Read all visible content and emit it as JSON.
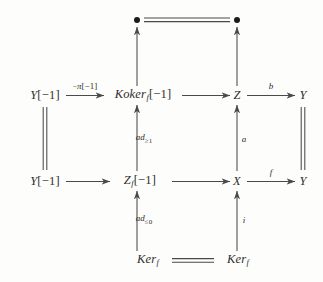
{
  "figure": {
    "kind": "commutative-diagram",
    "stroke_color": "#4a4a4a",
    "text_color": "#2e2e2e",
    "background_color": "#fdfdfb"
  },
  "nodes": [
    {
      "id": "dot-top-left",
      "label": "●",
      "plain": "bullet",
      "x": 137,
      "y": 20,
      "type": "dot"
    },
    {
      "id": "dot-top-right",
      "label": "●",
      "plain": "bullet",
      "x": 237,
      "y": 20,
      "type": "dot"
    },
    {
      "id": "y-shift-top",
      "label": "Y[−1]",
      "plain": "Y[-1]",
      "x": 45,
      "y": 95,
      "type": "text"
    },
    {
      "id": "koker-f-shift",
      "label": "Koker_f[−1]",
      "plain": "Koker_f[-1]",
      "x": 143,
      "y": 95,
      "type": "text"
    },
    {
      "id": "z",
      "label": "Z",
      "plain": "Z",
      "x": 237,
      "y": 95,
      "type": "text"
    },
    {
      "id": "y-top-right",
      "label": "Y",
      "plain": "Y",
      "x": 303,
      "y": 95,
      "type": "text"
    },
    {
      "id": "y-shift-bottom",
      "label": "Y[−1]",
      "plain": "Y[-1]",
      "x": 45,
      "y": 181,
      "type": "text"
    },
    {
      "id": "z-f-shift",
      "label": "Z_f[−1]",
      "plain": "Z_f[-1]",
      "x": 140,
      "y": 181,
      "type": "text"
    },
    {
      "id": "x",
      "label": "X",
      "plain": "X",
      "x": 237,
      "y": 181,
      "type": "text"
    },
    {
      "id": "y-bottom-right",
      "label": "Y",
      "plain": "Y",
      "x": 303,
      "y": 181,
      "type": "text"
    },
    {
      "id": "ker-f-left",
      "label": "Ker_f",
      "plain": "Ker_f",
      "x": 148,
      "y": 260,
      "type": "text"
    },
    {
      "id": "ker-f-right",
      "label": "Ker_f",
      "plain": "Ker_f",
      "x": 238,
      "y": 260,
      "type": "text"
    }
  ],
  "edges": [
    {
      "id": "edge-dot-equality",
      "from": "dot-top-left",
      "to": "dot-top-right",
      "style": "double-line",
      "direction": "horizontal",
      "label": ""
    },
    {
      "id": "edge-koker-to-dot",
      "from": "koker-f-shift",
      "to": "dot-top-left",
      "style": "arrow",
      "direction": "up",
      "label": ""
    },
    {
      "id": "edge-z-to-dot",
      "from": "z",
      "to": "dot-top-right",
      "style": "arrow",
      "direction": "up",
      "label": ""
    },
    {
      "id": "edge-y-to-koker",
      "from": "y-shift-top",
      "to": "koker-f-shift",
      "style": "arrow",
      "direction": "right",
      "label": "−π[−1]"
    },
    {
      "id": "edge-koker-to-z",
      "from": "koker-f-shift",
      "to": "z",
      "style": "arrow",
      "direction": "right",
      "label": ""
    },
    {
      "id": "edge-z-to-y",
      "from": "z",
      "to": "y-top-right",
      "style": "arrow",
      "direction": "right",
      "label": "b"
    },
    {
      "id": "edge-y-left-equality",
      "from": "y-shift-bottom",
      "to": "y-shift-top",
      "style": "double-line",
      "direction": "vertical",
      "label": ""
    },
    {
      "id": "edge-zf-to-koker",
      "from": "z-f-shift",
      "to": "koker-f-shift",
      "style": "arrow",
      "direction": "up",
      "label": "ad≥1"
    },
    {
      "id": "edge-x-to-z",
      "from": "x",
      "to": "z",
      "style": "arrow",
      "direction": "up",
      "label": "a"
    },
    {
      "id": "edge-y-right-equality",
      "from": "y-bottom-right",
      "to": "y-top-right",
      "style": "double-line",
      "direction": "vertical",
      "label": ""
    },
    {
      "id": "edge-y-to-zf",
      "from": "y-shift-bottom",
      "to": "z-f-shift",
      "style": "arrow",
      "direction": "right",
      "label": ""
    },
    {
      "id": "edge-zf-to-x",
      "from": "z-f-shift",
      "to": "x",
      "style": "arrow",
      "direction": "right",
      "label": ""
    },
    {
      "id": "edge-x-to-y",
      "from": "x",
      "to": "y-bottom-right",
      "style": "arrow",
      "direction": "right",
      "label": "f"
    },
    {
      "id": "edge-ker-to-zf",
      "from": "ker-f-left",
      "to": "z-f-shift",
      "style": "arrow",
      "direction": "up",
      "label": "ad≤0"
    },
    {
      "id": "edge-ker-to-x",
      "from": "ker-f-right",
      "to": "x",
      "style": "arrow",
      "direction": "up",
      "label": "i"
    },
    {
      "id": "edge-ker-equality",
      "from": "ker-f-left",
      "to": "ker-f-right",
      "style": "double-line",
      "direction": "horizontal",
      "label": ""
    }
  ],
  "labels": {
    "minus_pi_shift": {
      "sign": "−",
      "symbol": "π",
      "bracket": "[−1]"
    },
    "b": "b",
    "a": "a",
    "f": "f",
    "i": "i",
    "ad_geq1": {
      "base": "ad",
      "sub": "≥1"
    },
    "ad_leq0": {
      "base": "ad",
      "sub": "≤0"
    }
  },
  "node_text": {
    "y_shift_top": {
      "base": "Y",
      "bracket": "[−1]"
    },
    "y_shift_bottom": {
      "base": "Y",
      "bracket": "[−1]"
    },
    "koker": {
      "base": "Koker",
      "sub": "f",
      "bracket": "[−1]"
    },
    "zf": {
      "base": "Z",
      "sub": "f",
      "bracket": "[−1]"
    },
    "z": "Z",
    "x": "X",
    "y_top_right": "Y",
    "y_bottom_right": "Y",
    "ker_left": {
      "base": "Ker",
      "sub": "f"
    },
    "ker_right": {
      "base": "Ker",
      "sub": "f"
    }
  }
}
